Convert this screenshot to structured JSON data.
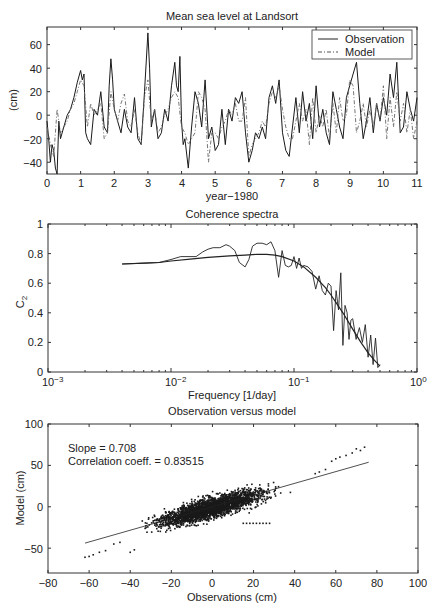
{
  "chart_data": [
    {
      "type": "line",
      "title": "Mean sea level at Landsort",
      "xlabel": "year−1980",
      "ylabel": "(cm)",
      "xlim": [
        0,
        11
      ],
      "ylim": [
        -50,
        75
      ],
      "xticks": [
        0,
        1,
        2,
        3,
        4,
        5,
        6,
        7,
        8,
        9,
        10,
        11
      ],
      "yticks": [
        -40,
        -20,
        0,
        20,
        40,
        60
      ],
      "grid": false,
      "legend": {
        "position": "upper right",
        "entries": [
          "Observation",
          "Model"
        ]
      },
      "series": [
        {
          "name": "Observation",
          "style": "solid",
          "x": [
            0.0,
            0.05,
            0.1,
            0.15,
            0.2,
            0.25,
            0.3,
            0.35,
            0.4,
            0.5,
            0.6,
            0.7,
            0.8,
            0.9,
            1.0,
            1.05,
            1.1,
            1.15,
            1.2,
            1.3,
            1.4,
            1.5,
            1.6,
            1.7,
            1.8,
            1.85,
            1.9,
            1.95,
            2.0,
            2.1,
            2.2,
            2.3,
            2.4,
            2.5,
            2.6,
            2.7,
            2.8,
            2.9,
            3.0,
            3.05,
            3.1,
            3.2,
            3.3,
            3.4,
            3.5,
            3.6,
            3.7,
            3.8,
            3.85,
            3.9,
            3.95,
            4.0,
            4.05,
            4.1,
            4.2,
            4.3,
            4.4,
            4.5,
            4.6,
            4.7,
            4.8,
            4.9,
            5.0,
            5.1,
            5.2,
            5.3,
            5.4,
            5.5,
            5.6,
            5.7,
            5.8,
            5.9,
            6.0,
            6.1,
            6.2,
            6.3,
            6.4,
            6.5,
            6.6,
            6.7,
            6.8,
            6.9,
            7.0,
            7.1,
            7.2,
            7.3,
            7.4,
            7.5,
            7.6,
            7.7,
            7.8,
            7.9,
            8.0,
            8.1,
            8.2,
            8.3,
            8.4,
            8.5,
            8.6,
            8.7,
            8.8,
            8.9,
            9.0,
            9.1,
            9.2,
            9.3,
            9.4,
            9.5,
            9.6,
            9.7,
            9.8,
            9.9,
            10.0,
            10.1,
            10.2,
            10.3,
            10.4,
            10.5,
            10.6,
            10.7,
            10.8,
            10.9,
            11.0
          ],
          "y": [
            -5,
            -20,
            -40,
            -25,
            -30,
            -45,
            -50,
            -5,
            -20,
            -10,
            0,
            5,
            15,
            28,
            38,
            30,
            35,
            -15,
            -20,
            -25,
            5,
            0,
            20,
            -10,
            -15,
            25,
            48,
            30,
            5,
            -5,
            -15,
            5,
            -10,
            -15,
            15,
            -20,
            -25,
            20,
            70,
            40,
            -10,
            5,
            -20,
            -15,
            5,
            -5,
            25,
            45,
            25,
            20,
            50,
            -5,
            -25,
            -20,
            -45,
            -10,
            20,
            10,
            -10,
            30,
            -20,
            -10,
            -30,
            -25,
            5,
            -25,
            5,
            -5,
            15,
            10,
            20,
            -15,
            -40,
            -30,
            -15,
            -20,
            -10,
            -20,
            15,
            25,
            10,
            30,
            -15,
            -30,
            -35,
            -10,
            15,
            -15,
            20,
            -5,
            10,
            -20,
            25,
            -10,
            5,
            -15,
            -25,
            20,
            5,
            -10,
            -20,
            15,
            25,
            35,
            45,
            10,
            -20,
            -5,
            15,
            -15,
            10,
            -5,
            15,
            0,
            35,
            15,
            45,
            -15,
            -10,
            20,
            5,
            -5,
            15,
            -10,
            -5
          ]
        },
        {
          "name": "Model",
          "style": "dashdot",
          "x": [
            0.0,
            0.1,
            0.2,
            0.3,
            0.4,
            0.5,
            0.6,
            0.7,
            0.8,
            0.9,
            1.0,
            1.1,
            1.2,
            1.3,
            1.4,
            1.5,
            1.6,
            1.7,
            1.8,
            1.9,
            2.0,
            2.1,
            2.2,
            2.3,
            2.4,
            2.5,
            2.6,
            2.7,
            2.8,
            2.9,
            3.0,
            3.1,
            3.2,
            3.3,
            3.4,
            3.5,
            3.6,
            3.7,
            3.8,
            3.9,
            4.0,
            4.1,
            4.2,
            4.3,
            4.4,
            4.5,
            4.6,
            4.7,
            4.8,
            4.9,
            5.0,
            5.1,
            5.2,
            5.3,
            5.4,
            5.5,
            5.6,
            5.7,
            5.8,
            5.9,
            6.0,
            6.1,
            6.2,
            6.3,
            6.4,
            6.5,
            6.6,
            6.7,
            6.8,
            6.9,
            7.0,
            7.1,
            7.2,
            7.3,
            7.4,
            7.5,
            7.6,
            7.7,
            7.8,
            7.9,
            8.0,
            8.1,
            8.2,
            8.3,
            8.4,
            8.5,
            8.6,
            8.7,
            8.8,
            8.9,
            9.0,
            9.1,
            9.2,
            9.3,
            9.4,
            9.5,
            9.6,
            9.7,
            9.8,
            9.9,
            10.0,
            10.1,
            10.2,
            10.3,
            10.4,
            10.5,
            10.6,
            10.7,
            10.8,
            10.9,
            11.0
          ],
          "y": [
            -10,
            -25,
            -35,
            5,
            -15,
            -10,
            -5,
            5,
            10,
            20,
            30,
            25,
            -10,
            10,
            0,
            5,
            10,
            -20,
            -15,
            20,
            5,
            -5,
            10,
            18,
            -5,
            -10,
            5,
            -15,
            -25,
            15,
            30,
            -5,
            5,
            -15,
            -10,
            0,
            5,
            15,
            20,
            15,
            -10,
            -15,
            -25,
            -20,
            -15,
            20,
            15,
            5,
            -40,
            -15,
            -15,
            -20,
            -10,
            -5,
            5,
            0,
            10,
            -5,
            -5,
            15,
            -35,
            -25,
            -20,
            -15,
            -5,
            -10,
            10,
            20,
            15,
            25,
            5,
            -10,
            -20,
            -20,
            -5,
            10,
            -5,
            5,
            -25,
            15,
            -15,
            0,
            -10,
            5,
            -20,
            10,
            -15,
            15,
            -5,
            0,
            30,
            25,
            -15,
            -5,
            10,
            -10,
            5,
            -10,
            10,
            -5,
            25,
            -20,
            15,
            -10,
            20,
            -5,
            10,
            -15,
            5,
            -20,
            -5
          ]
        }
      ]
    },
    {
      "type": "line",
      "title": "Coherence spectra",
      "xlabel": "Frequency [1/day]",
      "ylabel": "C2",
      "xscale": "log",
      "xlim": [
        0.001,
        1
      ],
      "ylim": [
        0,
        1
      ],
      "xticks": [
        "10^-3",
        "10^-2",
        "10^-1",
        "10^0"
      ],
      "yticks": [
        0,
        0.2,
        0.4,
        0.6,
        0.8,
        1
      ],
      "grid": false,
      "series": [
        {
          "name": "Coherence (raw)",
          "x": [
            0.004,
            0.006,
            0.008,
            0.01,
            0.012,
            0.014,
            0.016,
            0.018,
            0.02,
            0.022,
            0.025,
            0.028,
            0.03,
            0.033,
            0.036,
            0.04,
            0.043,
            0.046,
            0.05,
            0.055,
            0.06,
            0.065,
            0.07,
            0.075,
            0.08,
            0.085,
            0.09,
            0.095,
            0.1,
            0.105,
            0.11,
            0.115,
            0.12,
            0.13,
            0.14,
            0.15,
            0.16,
            0.17,
            0.18,
            0.19,
            0.2,
            0.21,
            0.22,
            0.23,
            0.24,
            0.25,
            0.26,
            0.27,
            0.28,
            0.29,
            0.3,
            0.32,
            0.34,
            0.36,
            0.38,
            0.4,
            0.42,
            0.44,
            0.46,
            0.48,
            0.5
          ],
          "y": [
            0.73,
            0.735,
            0.74,
            0.76,
            0.78,
            0.78,
            0.78,
            0.81,
            0.83,
            0.84,
            0.84,
            0.86,
            0.85,
            0.82,
            0.74,
            0.71,
            0.76,
            0.85,
            0.87,
            0.87,
            0.86,
            0.88,
            0.82,
            0.64,
            0.82,
            0.72,
            0.71,
            0.72,
            0.78,
            0.7,
            0.77,
            0.7,
            0.72,
            0.71,
            0.68,
            0.56,
            0.65,
            0.55,
            0.52,
            0.6,
            0.58,
            0.28,
            0.55,
            0.42,
            0.67,
            0.18,
            0.45,
            0.4,
            0.22,
            0.35,
            0.36,
            0.22,
            0.3,
            0.2,
            0.32,
            0.1,
            0.25,
            0.05,
            0.23,
            0.03,
            0.05
          ]
        },
        {
          "name": "Coherence (smoothed fit)",
          "x": [
            0.004,
            0.006,
            0.008,
            0.01,
            0.015,
            0.02,
            0.03,
            0.04,
            0.05,
            0.06,
            0.07,
            0.08,
            0.1,
            0.12,
            0.15,
            0.18,
            0.2,
            0.25,
            0.3,
            0.35,
            0.4,
            0.45,
            0.5
          ],
          "y": [
            0.73,
            0.735,
            0.74,
            0.75,
            0.765,
            0.775,
            0.785,
            0.79,
            0.795,
            0.795,
            0.79,
            0.78,
            0.75,
            0.71,
            0.64,
            0.57,
            0.52,
            0.4,
            0.29,
            0.2,
            0.13,
            0.08,
            0.04
          ]
        }
      ]
    },
    {
      "type": "scatter",
      "title": "Observation versus model",
      "xlabel": "Observations (cm)",
      "ylabel": "Model (cm)",
      "xlim": [
        -80,
        100
      ],
      "ylim": [
        -80,
        100
      ],
      "xticks": [
        -80,
        -60,
        -40,
        -20,
        0,
        20,
        40,
        60,
        80,
        100
      ],
      "yticks": [
        -50,
        0,
        50,
        100
      ],
      "grid": false,
      "annotations": [
        "Slope = 0.708",
        "Correlation coeff. = 0.83515"
      ],
      "fit_line": {
        "slope": 0.708,
        "x": [
          -62,
          76
        ],
        "y": [
          -43.9,
          53.8
        ]
      },
      "cluster": {
        "center": [
          0,
          -5
        ],
        "x_range": [
          -63,
          76
        ],
        "y_range": [
          -62,
          72
        ],
        "correlation": 0.83515
      }
    }
  ],
  "plots": {
    "top": {
      "title": "Mean sea level at Landsort",
      "xlabel": "year−1980",
      "ylabel": "(cm)",
      "xtick_labels": [
        "0",
        "1",
        "2",
        "3",
        "4",
        "5",
        "6",
        "7",
        "8",
        "9",
        "10",
        "11"
      ],
      "ytick_labels": [
        "60",
        "40",
        "20",
        "0",
        "−20",
        "−40"
      ],
      "legend": {
        "observation": "Observation",
        "model": "Model"
      }
    },
    "middle": {
      "title": "Coherence spectra",
      "xlabel": "Frequency [1/day]",
      "ylabel_main": "C",
      "ylabel_sub": "2",
      "ytick_labels": [
        "1",
        "0.8",
        "0.6",
        "0.4",
        "0.2",
        "0"
      ],
      "xtick_bases": [
        "10",
        "10",
        "10",
        "10"
      ],
      "xtick_exps": [
        "−3",
        "−2",
        "−1",
        "0"
      ]
    },
    "bottom": {
      "title": "Observation versus model",
      "xlabel": "Observations (cm)",
      "ylabel": "Model (cm)",
      "xtick_labels": [
        "−80",
        "−60",
        "−40",
        "−20",
        "0",
        "20",
        "40",
        "60",
        "80",
        "100"
      ],
      "ytick_labels": [
        "100",
        "50",
        "0",
        "−50"
      ],
      "annotation_slope": "Slope = 0.708",
      "annotation_corr": "Correlation coeff. = 0.83515"
    }
  }
}
